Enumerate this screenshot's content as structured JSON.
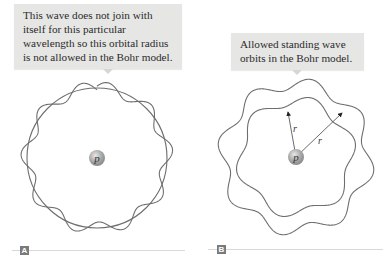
{
  "figure": {
    "panel_a": {
      "label": "A",
      "callout": "This wave does not join with itself for this particular wavelength so this orbital radius is not allowed in the Bohr model.",
      "nucleus_label": "p",
      "wave_cycles": 9.5,
      "wave_closes": false
    },
    "panel_b": {
      "label": "B",
      "callout": "Allowed standing wave orbits in the Bohr model.",
      "nucleus_label": "p",
      "radius_label": "r",
      "orbits": [
        {
          "name": "inner",
          "wave_cycles": 6
        },
        {
          "name": "outer",
          "wave_cycles": 8
        }
      ]
    }
  },
  "colors": {
    "callout_bg": "#e6e6e5",
    "wave": "#6e6e6e",
    "nucleus": "#9a9a9a",
    "label_box": "#7a7a7a"
  }
}
